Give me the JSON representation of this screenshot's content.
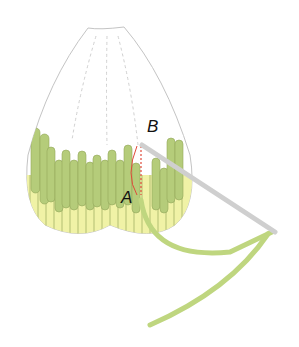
{
  "diagram": {
    "type": "embroidery-stitch-illustration",
    "labels": {
      "a": "A",
      "b": "B"
    },
    "colors": {
      "outline": "#bdbdbd",
      "stitch_dark": "#b5cc7a",
      "stitch_light": "#f0f2a6",
      "needle": "#d8d8d8",
      "thread": "#bfd67f",
      "guide": "#e04a3a"
    }
  }
}
